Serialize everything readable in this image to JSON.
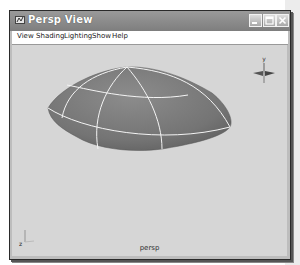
{
  "window": {
    "title": "Persp View",
    "title_icon": "maya-view-icon",
    "buttons": [
      {
        "name": "minimize-button",
        "icon": "minimize-icon"
      },
      {
        "name": "maximize-button",
        "icon": "maximize-icon"
      },
      {
        "name": "close-button",
        "icon": "close-icon"
      }
    ]
  },
  "menubar": {
    "items": [
      {
        "label": "View"
      },
      {
        "label": "Shading"
      },
      {
        "label": "Lighting"
      },
      {
        "label": "Show"
      },
      {
        "label": "Help"
      }
    ]
  },
  "viewport": {
    "camera_label": "persp",
    "object": "nurbs-sphere-deformed",
    "view_cube_axis_label": "y",
    "origin_axis_label": "z",
    "colors": {
      "background": "#d6d6d6",
      "object_fill": "#7a7a7a",
      "wireframe": "#ffffff"
    }
  }
}
